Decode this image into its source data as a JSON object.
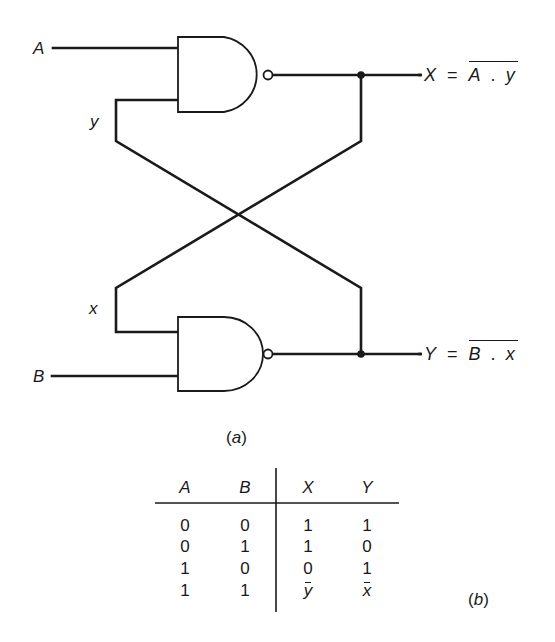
{
  "figure": {
    "circuit": {
      "inputs": [
        {
          "name": "A",
          "label": "A"
        },
        {
          "name": "B",
          "label": "B"
        }
      ],
      "feedback_labels": {
        "y": "y",
        "x": "x"
      },
      "gates": [
        {
          "id": "nand-top",
          "type": "NAND",
          "inputs": [
            "A",
            "y"
          ],
          "output": "X"
        },
        {
          "id": "nand-bottom",
          "type": "NAND",
          "inputs": [
            "x",
            "B"
          ],
          "output": "Y"
        }
      ],
      "outputs": {
        "top": {
          "lhs": "X",
          "equals": "=",
          "rhs_a": "A",
          "dot": ".",
          "rhs_b": "y"
        },
        "bottom": {
          "lhs": "Y",
          "equals": "=",
          "rhs_a": "B",
          "dot": ".",
          "rhs_b": "x"
        }
      },
      "caption": "(a)",
      "caption_letter": "a"
    },
    "truth_table": {
      "headers": [
        "A",
        "B",
        "X",
        "Y"
      ],
      "rows": [
        [
          "0",
          "0",
          "1",
          "1"
        ],
        [
          "0",
          "1",
          "1",
          "0"
        ],
        [
          "1",
          "0",
          "0",
          "1"
        ],
        [
          "1",
          "1",
          "y",
          "x"
        ]
      ],
      "row_notes": "Last row X and Y are complements: y-bar and x-bar (previous state held)",
      "caption": "(b)",
      "caption_letter": "b"
    }
  }
}
